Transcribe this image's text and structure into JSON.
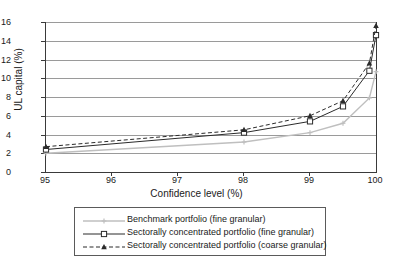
{
  "chart_data": {
    "type": "line",
    "title": "",
    "xlabel": "Confidence level (%)",
    "ylabel": "UL capital (%)",
    "xlim": [
      95,
      100
    ],
    "ylim": [
      0,
      16
    ],
    "grid": true,
    "legend_position": "below",
    "x_ticks": [
      "95",
      "96",
      "97",
      "98",
      "99",
      "100"
    ],
    "y_ticks": [
      "0",
      "2",
      "4",
      "6",
      "8",
      "10",
      "12",
      "14",
      "16"
    ],
    "x": [
      95,
      98,
      99,
      99.5,
      99.9,
      100
    ],
    "series": [
      {
        "name": "Benchmark portfolio (fine granular)",
        "color": "#bfbfbf",
        "marker": "cross",
        "dash": "solid",
        "values": [
          2.0,
          3.2,
          4.2,
          5.2,
          7.9,
          10.7
        ]
      },
      {
        "name": "Sectorally concentrated portfolio (fine granular)",
        "color": "#2b2b2b",
        "marker": "open-square",
        "dash": "solid",
        "values": [
          2.4,
          4.2,
          5.4,
          7.0,
          10.8,
          14.6
        ]
      },
      {
        "name": "Sectorally concentrated portfolio (coarse granular)",
        "color": "#2b2b2b",
        "marker": "filled-triangle",
        "dash": "dashed",
        "values": [
          2.7,
          4.5,
          6.0,
          7.6,
          11.6,
          15.6
        ]
      }
    ]
  },
  "legend": {
    "entries": [
      "Benchmark portfolio (fine granular)",
      "Sectorally concentrated portfolio (fine granular)",
      "Sectorally concentrated portfolio (coarse granular)"
    ]
  }
}
